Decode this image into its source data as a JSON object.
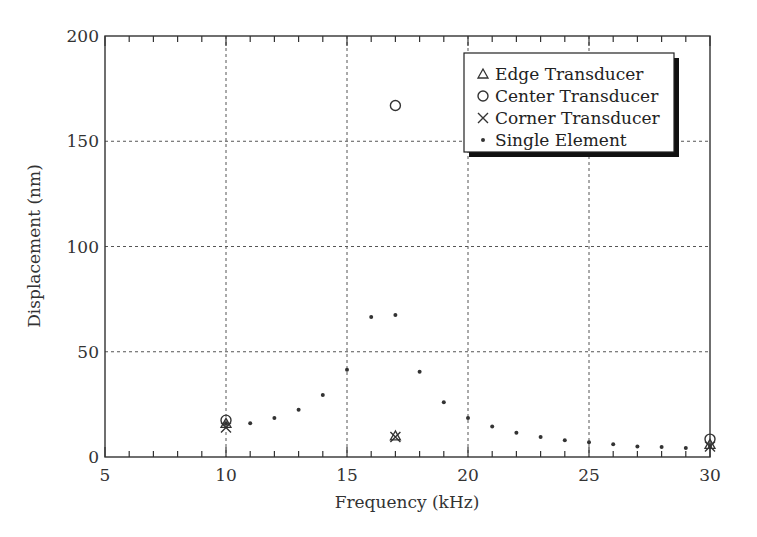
{
  "chart_data": {
    "type": "scatter",
    "title": "",
    "xlabel": "Frequency (kHz)",
    "ylabel": "Displacement (nm)",
    "xlim": [
      5,
      30
    ],
    "ylim": [
      0,
      200
    ],
    "xticks": [
      5,
      10,
      15,
      20,
      25,
      30
    ],
    "yticks": [
      0,
      50,
      100,
      150,
      200
    ],
    "xtick_labels": [
      "5",
      "10",
      "15",
      "20",
      "25",
      "30"
    ],
    "ytick_labels": [
      "0",
      "50",
      "100",
      "150",
      "200"
    ],
    "x_minor_tick_step": 1,
    "grid": true,
    "grid_style": "dotted",
    "legend_position": "upper right",
    "series": [
      {
        "name": "Edge Transducer",
        "marker": "triangle",
        "x": [
          10,
          17,
          30
        ],
        "y": [
          16,
          10,
          6
        ]
      },
      {
        "name": "Center Transducer",
        "marker": "circle",
        "x": [
          10,
          17,
          30
        ],
        "y": [
          17.5,
          167,
          8.5
        ]
      },
      {
        "name": "Corner Transducer",
        "marker": "x",
        "x": [
          10,
          17,
          30
        ],
        "y": [
          14,
          9.5,
          5
        ]
      },
      {
        "name": "Single Element",
        "marker": "dot",
        "x": [
          10,
          11,
          12,
          13,
          14,
          15,
          16,
          17,
          18,
          19,
          20,
          21,
          22,
          23,
          24,
          25,
          26,
          27,
          28,
          29,
          30
        ],
        "y": [
          16,
          16,
          18.5,
          22.5,
          29.5,
          41.5,
          66.5,
          67.5,
          40.5,
          26,
          18.5,
          14.5,
          11.5,
          9.5,
          8,
          7,
          6,
          5,
          4.8,
          4.3,
          5
        ]
      }
    ]
  },
  "colors": {
    "axis": "#333333",
    "grid": "#555555",
    "marker": "#333333",
    "legend_shadow": "#111111"
  }
}
